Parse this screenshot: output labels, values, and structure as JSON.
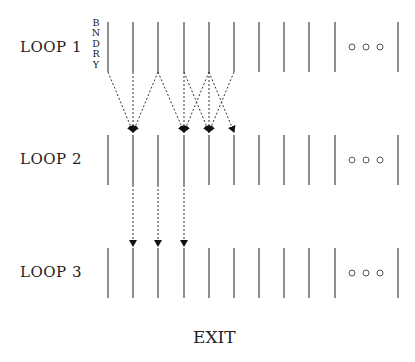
{
  "diagram": {
    "loops": [
      {
        "label": "LOOP 1",
        "y_top": 22,
        "y_bottom": 72,
        "label_y": 38
      },
      {
        "label": "LOOP 2",
        "y_top": 135,
        "y_bottom": 185,
        "label_y": 150
      },
      {
        "label": "LOOP 3",
        "y_top": 248,
        "y_bottom": 298,
        "label_y": 263
      }
    ],
    "boundary_label": [
      "B",
      "N",
      "D",
      "R",
      "Y"
    ],
    "columns_x": [
      108,
      133,
      158,
      184,
      209,
      234,
      259,
      284,
      309,
      335
    ],
    "last_column_x": 398,
    "ellipsis_circles_x": [
      352,
      366,
      380
    ],
    "arrows_loop1_to_loop2": [
      {
        "from": 108,
        "to": 133
      },
      {
        "from": 133,
        "to": 133
      },
      {
        "from": 158,
        "to": 133
      },
      {
        "from": 158,
        "to": 184
      },
      {
        "from": 184,
        "to": 184
      },
      {
        "from": 184,
        "to": 209
      },
      {
        "from": 209,
        "to": 184
      },
      {
        "from": 209,
        "to": 209
      },
      {
        "from": 209,
        "to": 234
      },
      {
        "from": 234,
        "to": 209
      }
    ],
    "arrows_loop2_to_loop3": [
      {
        "from": 133,
        "to": 133
      },
      {
        "from": 158,
        "to": 158
      },
      {
        "from": 184,
        "to": 184
      }
    ],
    "exit_label": "EXIT"
  }
}
